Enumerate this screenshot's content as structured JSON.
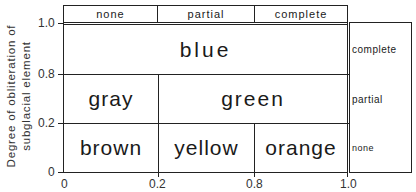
{
  "diagram": {
    "y_axis_title_line1": "Degree of obliteration of",
    "y_axis_title_line2": "subglacial element",
    "y_ticks": [
      "1.0",
      "0.8",
      "0.2",
      "0"
    ],
    "x_ticks": [
      "0",
      "0.2",
      "0.8",
      "1.0"
    ],
    "top_header": [
      "none",
      "partial",
      "complete"
    ],
    "right_header": [
      "complete",
      "partial",
      "none"
    ],
    "cells": {
      "top_row": "blue",
      "middle_left": "gray",
      "middle_right": "green",
      "bottom_left": "brown",
      "bottom_middle": "yellow",
      "bottom_right": "orange"
    }
  }
}
